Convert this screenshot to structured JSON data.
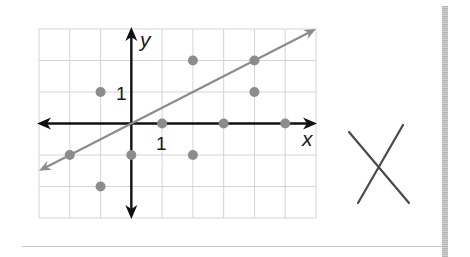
{
  "chart_data": {
    "type": "scatter",
    "title": "",
    "xlabel": "x",
    "ylabel": "y",
    "xlim": [
      -3,
      6
    ],
    "ylim": [
      -3,
      3
    ],
    "grid": true,
    "tick_labels": {
      "x": [
        "1"
      ],
      "y": [
        "1"
      ]
    },
    "series": [
      {
        "name": "points",
        "type": "scatter",
        "color": "#8c8c8c",
        "points": [
          {
            "x": -1,
            "y": 1
          },
          {
            "x": 2,
            "y": 2
          },
          {
            "x": 4,
            "y": 2
          },
          {
            "x": 4,
            "y": 1
          },
          {
            "x": 1,
            "y": 0
          },
          {
            "x": 3,
            "y": 0
          },
          {
            "x": 5,
            "y": 0
          },
          {
            "x": -2,
            "y": -1
          },
          {
            "x": 0,
            "y": -1
          },
          {
            "x": 2,
            "y": -1
          },
          {
            "x": -1,
            "y": -2
          }
        ]
      },
      {
        "name": "line",
        "type": "line",
        "color": "#8c8c8c",
        "equation": "y = x/2",
        "points": [
          {
            "x": -3,
            "y": -1.5
          },
          {
            "x": 6,
            "y": 3
          }
        ]
      }
    ],
    "answer_mark": "X"
  },
  "labels": {
    "x_axis": "x",
    "y_axis": "y",
    "x_tick": "1",
    "y_tick": "1"
  },
  "colors": {
    "axis": "#111111",
    "grid": "#d4d4d4",
    "points": "#8c8c8c",
    "line": "#8c8c8c",
    "mark": "#4a4a4a"
  }
}
